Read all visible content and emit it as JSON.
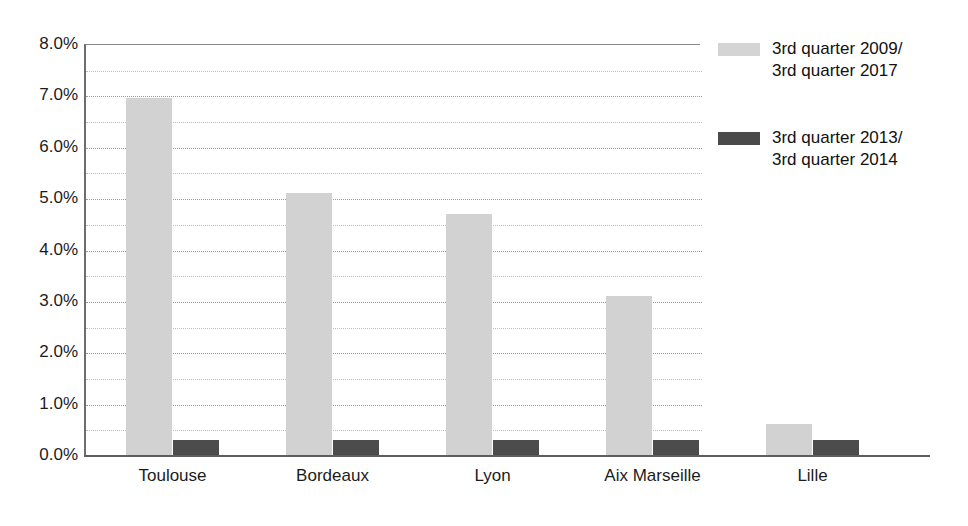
{
  "chart_data": {
    "type": "bar",
    "title": "",
    "subtitle": "",
    "xlabel": "",
    "ylabel": "",
    "categories": [
      "Toulouse",
      "Bordeaux",
      "Lyon",
      "Aix Marseille",
      "Lille"
    ],
    "series": [
      {
        "name": "3rd quarter 2009/\n3rd quarter 2017",
        "color": "#d2d2d2",
        "values": [
          6.95,
          5.1,
          4.7,
          3.1,
          0.6
        ]
      },
      {
        "name": "3rd quarter 2013/\n3rd quarter 2014",
        "color": "#4c4c4c",
        "values": [
          0.3,
          0.3,
          0.3,
          0.3,
          0.3
        ]
      }
    ],
    "ylim": [
      0,
      8
    ],
    "y_tick_step": 1,
    "y_minor_step": 0.5,
    "y_tick_labels": [
      "0.0%",
      "1.0%",
      "2.0%",
      "3.0%",
      "4.0%",
      "5.0%",
      "6.0%",
      "7.0%",
      "8.0%"
    ],
    "grid": true,
    "grid_axis": "y",
    "legend_position": "right",
    "value_suffix": "%"
  },
  "legend": {
    "entries": [
      {
        "label": "3rd quarter 2009/\n3rd quarter 2017",
        "color": "#d4d4d4"
      },
      {
        "label": "3rd quarter 2013/\n3rd quarter 2014",
        "color": "#4a4a4a"
      }
    ]
  },
  "axes": {
    "y_ticks": [
      "8.0%",
      "7.0%",
      "6.0%",
      "5.0%",
      "4.0%",
      "3.0%",
      "2.0%",
      "1.0%",
      "0.0%"
    ],
    "x_categories": [
      "Toulouse",
      "Bordeaux",
      "Lyon",
      "Aix Marseille",
      "Lille"
    ]
  }
}
